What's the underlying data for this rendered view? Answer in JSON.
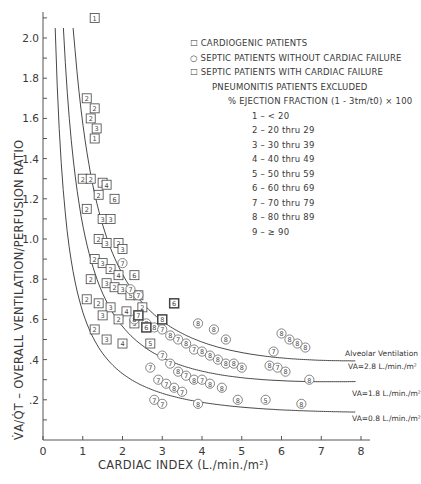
{
  "chart_data": {
    "type": "scatter",
    "title": "",
    "xlabel": "CARDIAC INDEX (L./min./m²)",
    "ylabel": "V̇A/Q̇T – OVERALL VENTILATION/PERFUSION RATIO",
    "xlim": [
      0,
      8
    ],
    "ylim": [
      0,
      2.1
    ],
    "x_ticks": [
      "0",
      "1",
      "2",
      "3",
      "4",
      "5",
      "6",
      "7",
      "8"
    ],
    "y_ticks": [
      "0",
      ".2",
      ".4",
      ".6",
      ".8",
      "1.0",
      "1.2",
      "1.4",
      "1.6",
      "1.8",
      "2.0"
    ],
    "grid": false,
    "legend": {
      "position": "upper right",
      "entries": [
        {
          "marker": "square",
          "label": "CARDIOGENIC PATIENTS"
        },
        {
          "marker": "circle",
          "label": "SEPTIC PATIENTS WITHOUT CARDIAC FAILURE"
        },
        {
          "marker": "square-bold",
          "label": "SEPTIC PATIENTS WITH CARDIAC FAILURE"
        }
      ],
      "note": "PNEUMONITIS PATIENTS EXCLUDED",
      "code_title": "% EJECTION FRACTION (1 - 3tm/t0) × 100",
      "codes": [
        {
          "code": "1",
          "range": "< 20"
        },
        {
          "code": "2",
          "range": "20 thru 29"
        },
        {
          "code": "3",
          "range": "30 thru 39"
        },
        {
          "code": "4",
          "range": "40 thru 49"
        },
        {
          "code": "5",
          "range": "50 thru 59"
        },
        {
          "code": "6",
          "range": "60 thru 69"
        },
        {
          "code": "7",
          "range": "70 thru 79"
        },
        {
          "code": "8",
          "range": "80 thru 89"
        },
        {
          "code": "9",
          "range": "≥ 90"
        }
      ]
    },
    "curves_title": "Alveolar Ventilation",
    "curves": [
      {
        "name": "VA=2.8 L./min./m²",
        "VA": 2.8
      },
      {
        "name": "VA=1.8 L./min./m²",
        "VA": 1.8
      },
      {
        "name": "VA=0.8 L./min./m²",
        "VA": 0.8
      }
    ],
    "series": [
      {
        "name": "Cardiogenic",
        "marker": "square",
        "points": [
          [
            1.3,
            2.1,
            1
          ],
          [
            1.1,
            1.7,
            2
          ],
          [
            1.3,
            1.65,
            2
          ],
          [
            1.2,
            1.6,
            2
          ],
          [
            1.35,
            1.55,
            3
          ],
          [
            1.3,
            1.5,
            1
          ],
          [
            1.0,
            1.3,
            2
          ],
          [
            1.2,
            1.3,
            2
          ],
          [
            1.5,
            1.28,
            3
          ],
          [
            1.6,
            1.27,
            4
          ],
          [
            1.4,
            1.22,
            2
          ],
          [
            1.8,
            1.2,
            6
          ],
          [
            1.1,
            1.15,
            2
          ],
          [
            1.5,
            1.1,
            3
          ],
          [
            1.7,
            1.1,
            3
          ],
          [
            1.4,
            1.0,
            2
          ],
          [
            1.6,
            0.98,
            3
          ],
          [
            1.9,
            0.98,
            2
          ],
          [
            2.0,
            0.95,
            3
          ],
          [
            1.3,
            0.9,
            2
          ],
          [
            1.5,
            0.88,
            3
          ],
          [
            1.7,
            0.85,
            2
          ],
          [
            1.9,
            0.82,
            4
          ],
          [
            2.3,
            0.82,
            6
          ],
          [
            1.2,
            0.8,
            2
          ],
          [
            1.6,
            0.78,
            3
          ],
          [
            1.8,
            0.76,
            2
          ],
          [
            2.0,
            0.75,
            3
          ],
          [
            2.2,
            0.72,
            5
          ],
          [
            2.4,
            0.72,
            3
          ],
          [
            1.1,
            0.7,
            2
          ],
          [
            1.4,
            0.68,
            2
          ],
          [
            1.7,
            0.66,
            3
          ],
          [
            2.1,
            0.64,
            4
          ],
          [
            2.5,
            0.66,
            2
          ],
          [
            1.5,
            0.62,
            3
          ],
          [
            1.9,
            0.6,
            2
          ],
          [
            2.3,
            0.58,
            3
          ],
          [
            1.3,
            0.55,
            2
          ],
          [
            1.6,
            0.5,
            3
          ],
          [
            2.0,
            0.48,
            4
          ],
          [
            2.7,
            0.48,
            5
          ]
        ]
      },
      {
        "name": "Septic without cardiac failure",
        "marker": "circle",
        "points": [
          [
            2.0,
            0.88,
            7
          ],
          [
            2.2,
            0.75,
            7
          ],
          [
            2.4,
            0.72,
            7
          ],
          [
            2.3,
            0.6,
            8
          ],
          [
            2.6,
            0.58,
            7
          ],
          [
            2.8,
            0.56,
            8
          ],
          [
            3.0,
            0.55,
            7
          ],
          [
            3.2,
            0.52,
            8
          ],
          [
            3.4,
            0.5,
            7
          ],
          [
            3.6,
            0.48,
            8
          ],
          [
            3.8,
            0.45,
            7
          ],
          [
            4.0,
            0.44,
            8
          ],
          [
            4.2,
            0.42,
            8
          ],
          [
            4.4,
            0.4,
            8
          ],
          [
            4.6,
            0.38,
            8
          ],
          [
            4.8,
            0.38,
            8
          ],
          [
            5.0,
            0.36,
            8
          ],
          [
            3.0,
            0.42,
            7
          ],
          [
            3.2,
            0.38,
            7
          ],
          [
            3.4,
            0.34,
            8
          ],
          [
            3.6,
            0.32,
            7
          ],
          [
            3.8,
            0.3,
            8
          ],
          [
            4.0,
            0.3,
            7
          ],
          [
            4.2,
            0.28,
            8
          ],
          [
            2.7,
            0.36,
            7
          ],
          [
            2.9,
            0.3,
            7
          ],
          [
            3.1,
            0.28,
            7
          ],
          [
            3.3,
            0.26,
            8
          ],
          [
            3.5,
            0.24,
            7
          ],
          [
            4.5,
            0.26,
            8
          ],
          [
            2.8,
            0.2,
            7
          ],
          [
            3.0,
            0.18,
            7
          ],
          [
            3.9,
            0.18,
            8
          ],
          [
            4.9,
            0.2,
            8
          ],
          [
            5.6,
            0.2,
            5
          ],
          [
            6.5,
            0.18,
            8
          ],
          [
            6.0,
            0.53,
            8
          ],
          [
            6.2,
            0.5,
            8
          ],
          [
            6.4,
            0.48,
            8
          ],
          [
            5.8,
            0.44,
            7
          ],
          [
            6.6,
            0.46,
            8
          ],
          [
            5.7,
            0.37,
            8
          ],
          [
            5.9,
            0.36,
            7
          ],
          [
            6.1,
            0.34,
            8
          ],
          [
            6.7,
            0.3,
            8
          ],
          [
            4.3,
            0.55,
            8
          ],
          [
            4.6,
            0.5,
            8
          ],
          [
            3.9,
            0.58,
            8
          ]
        ]
      },
      {
        "name": "Septic with cardiac failure",
        "marker": "square-bold",
        "points": [
          [
            2.4,
            0.62,
            7
          ],
          [
            2.6,
            0.56,
            6
          ],
          [
            3.0,
            0.6,
            8
          ],
          [
            3.3,
            0.68,
            6
          ]
        ]
      }
    ]
  },
  "labels": {
    "alv_title": "Alveolar Ventilation",
    "va28": "VA=2.8 L./min./m²",
    "va18": "VA=1.8 L./min./m²",
    "va08": "VA=0.8 L./min./m²"
  }
}
